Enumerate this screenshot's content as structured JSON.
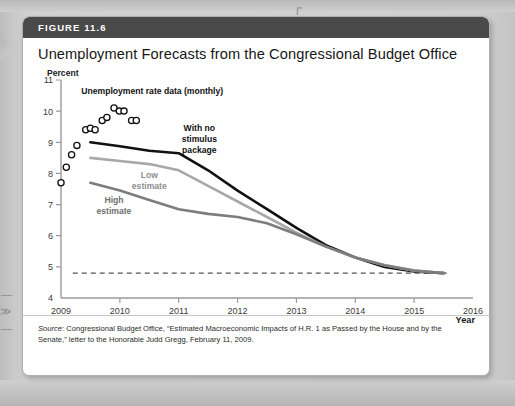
{
  "figure": {
    "banner_label": "FIGURE 11.6",
    "title": "Unemployment Forecasts from the Congressional Budget Office",
    "source_word": "Source:",
    "source_text": " Congressional Budget Office, “Estimated Macroeconomic Impacts of H.R. 1 as Passed by the House and by the Senate,” letter to the Honorable Judd Gregg, February 11, 2009."
  },
  "colors": {
    "banner_bg": "#4a4a4a",
    "card_bg": "#ffffff",
    "page_bg": "#cdcdcd",
    "no_stimulus_line": "#111111",
    "low_estimate_line": "#a8a8a8",
    "high_estimate_line": "#7d7d7d",
    "axis": "#9a9a9a",
    "dashed_line": "#555555"
  },
  "chart_data": {
    "type": "line",
    "title": "Unemployment Forecasts from the Congressional Budget Office",
    "xlabel": "Year",
    "ylabel": "Percent",
    "xlim": [
      2009,
      2016
    ],
    "ylim": [
      4,
      11
    ],
    "xticks": [
      "2009",
      "2010",
      "2011",
      "2012",
      "2013",
      "2014",
      "2015",
      "2016"
    ],
    "yticks": [
      "4",
      "5",
      "6",
      "7",
      "8",
      "9",
      "10",
      "11"
    ],
    "grid": false,
    "legend_position": "inline-annotations",
    "annotations": [
      {
        "text": "Unemployment rate data (monthly)",
        "x": 2010.55,
        "y": 10.55,
        "color": "#111111"
      },
      {
        "text": "With no",
        "x": 2011.35,
        "y": 9.35,
        "color": "#111111"
      },
      {
        "text": "stimulus",
        "x": 2011.35,
        "y": 9.0,
        "color": "#111111"
      },
      {
        "text": "package",
        "x": 2011.35,
        "y": 8.65,
        "color": "#111111"
      },
      {
        "text": "Low",
        "x": 2010.5,
        "y": 7.85,
        "color": "#8e8e8e"
      },
      {
        "text": "estimate",
        "x": 2010.5,
        "y": 7.5,
        "color": "#8e8e8e"
      },
      {
        "text": "High",
        "x": 2009.9,
        "y": 7.05,
        "color": "#6f6f6f"
      },
      {
        "text": "estimate",
        "x": 2009.9,
        "y": 6.7,
        "color": "#6f6f6f"
      }
    ],
    "scatter": {
      "name": "Unemployment rate data (monthly)",
      "marker": "open-circle",
      "points": [
        {
          "x": 2009.0,
          "y": 7.7
        },
        {
          "x": 2009.09,
          "y": 8.2
        },
        {
          "x": 2009.18,
          "y": 8.6
        },
        {
          "x": 2009.27,
          "y": 8.9
        },
        {
          "x": 2009.42,
          "y": 9.4
        },
        {
          "x": 2009.5,
          "y": 9.45
        },
        {
          "x": 2009.58,
          "y": 9.4
        },
        {
          "x": 2009.7,
          "y": 9.7
        },
        {
          "x": 2009.78,
          "y": 9.8
        },
        {
          "x": 2009.9,
          "y": 10.1
        },
        {
          "x": 2009.99,
          "y": 10.0
        },
        {
          "x": 2010.07,
          "y": 10.0
        },
        {
          "x": 2010.2,
          "y": 9.7
        },
        {
          "x": 2010.28,
          "y": 9.7
        }
      ]
    },
    "series": [
      {
        "name": "With no stimulus package",
        "color": "#111111",
        "points": [
          {
            "x": 2009.5,
            "y": 9.0
          },
          {
            "x": 2010.0,
            "y": 8.87
          },
          {
            "x": 2010.5,
            "y": 8.73
          },
          {
            "x": 2011.0,
            "y": 8.65
          },
          {
            "x": 2011.5,
            "y": 8.1
          },
          {
            "x": 2012.0,
            "y": 7.45
          },
          {
            "x": 2012.5,
            "y": 6.85
          },
          {
            "x": 2013.0,
            "y": 6.25
          },
          {
            "x": 2013.5,
            "y": 5.7
          },
          {
            "x": 2014.0,
            "y": 5.3
          },
          {
            "x": 2014.5,
            "y": 5.0
          },
          {
            "x": 2015.0,
            "y": 4.85
          },
          {
            "x": 2015.5,
            "y": 4.8
          }
        ]
      },
      {
        "name": "Low estimate",
        "color": "#a8a8a8",
        "points": [
          {
            "x": 2009.5,
            "y": 8.5
          },
          {
            "x": 2010.0,
            "y": 8.4
          },
          {
            "x": 2010.5,
            "y": 8.3
          },
          {
            "x": 2011.0,
            "y": 8.1
          },
          {
            "x": 2011.5,
            "y": 7.6
          },
          {
            "x": 2012.0,
            "y": 7.1
          },
          {
            "x": 2012.5,
            "y": 6.6
          },
          {
            "x": 2013.0,
            "y": 6.1
          },
          {
            "x": 2013.5,
            "y": 5.65
          },
          {
            "x": 2014.0,
            "y": 5.3
          },
          {
            "x": 2014.5,
            "y": 5.05
          },
          {
            "x": 2015.0,
            "y": 4.88
          },
          {
            "x": 2015.5,
            "y": 4.8
          }
        ]
      },
      {
        "name": "High estimate",
        "color": "#7d7d7d",
        "points": [
          {
            "x": 2009.5,
            "y": 7.7
          },
          {
            "x": 2010.0,
            "y": 7.45
          },
          {
            "x": 2010.5,
            "y": 7.15
          },
          {
            "x": 2011.0,
            "y": 6.85
          },
          {
            "x": 2011.5,
            "y": 6.7
          },
          {
            "x": 2012.0,
            "y": 6.6
          },
          {
            "x": 2012.5,
            "y": 6.4
          },
          {
            "x": 2013.0,
            "y": 6.05
          },
          {
            "x": 2013.5,
            "y": 5.65
          },
          {
            "x": 2014.0,
            "y": 5.3
          },
          {
            "x": 2014.5,
            "y": 5.05
          },
          {
            "x": 2015.0,
            "y": 4.88
          },
          {
            "x": 2015.5,
            "y": 4.8
          }
        ]
      }
    ],
    "reference_line": {
      "name": "natural rate",
      "style": "dashed",
      "y": 4.8,
      "x_start": 2009.2,
      "x_end": 2015.6,
      "color": "#555555"
    }
  },
  "page_marks": {
    "mark_top": "Γ",
    "mark_left1": "—",
    "mark_left2": "≫",
    "mark_left3": "—"
  }
}
